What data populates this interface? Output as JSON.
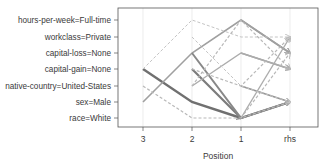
{
  "chart_data": {
    "type": "line",
    "title": "",
    "subtitle": "Parallel coordinates plot of association rules",
    "xlabel": "Position",
    "ylabel": "",
    "x": [
      "3",
      "2",
      "1",
      "rhs"
    ],
    "y_categories": [
      "hours-per-week=Full-time",
      "workclass=Private",
      "capital-loss=None",
      "capital-gain=None",
      "native-country=United-States",
      "sex=Male",
      "race=White"
    ],
    "grid": true,
    "legend": "none",
    "series": [
      {
        "name": "rule-a",
        "values": [
          3,
          5,
          6,
          7
        ],
        "weight": 0.9
      },
      {
        "name": "rule-b",
        "values": [
          5,
          2,
          0,
          2
        ],
        "weight": 0.5
      },
      {
        "name": "rule-c",
        "values": [
          null,
          3,
          6,
          5
        ],
        "weight": 0.8
      },
      {
        "name": "rule-d",
        "values": [
          null,
          2,
          6,
          5
        ],
        "weight": 0.7
      },
      {
        "name": "rule-e",
        "values": [
          null,
          null,
          4,
          5
        ],
        "weight": 0.6
      },
      {
        "name": "rule-f",
        "values": [
          null,
          null,
          0,
          2
        ],
        "weight": 0.5
      },
      {
        "name": "rule-g",
        "values": [
          null,
          null,
          2,
          3
        ],
        "weight": 0.5
      },
      {
        "name": "rule-h",
        "values": [
          null,
          4,
          2,
          3
        ],
        "weight": 0.4
      },
      {
        "name": "rule-i",
        "values": [
          4,
          6,
          6,
          5
        ],
        "weight": 0.3
      },
      {
        "name": "rule-j",
        "values": [
          null,
          null,
          6,
          1
        ],
        "weight": 0.4
      },
      {
        "name": "rule-k",
        "values": [
          null,
          null,
          6,
          2
        ],
        "weight": 0.3
      },
      {
        "name": "rule-l",
        "values": [
          null,
          3,
          4,
          1
        ],
        "weight": 0.3
      },
      {
        "name": "rule-m",
        "values": [
          3,
          0,
          1,
          1
        ],
        "weight": 0.2
      },
      {
        "name": "rule-n",
        "values": [
          null,
          1,
          4,
          5
        ],
        "weight": 0.2
      },
      {
        "name": "rule-o",
        "values": [
          null,
          4,
          0,
          3
        ],
        "weight": 0.3
      }
    ]
  }
}
